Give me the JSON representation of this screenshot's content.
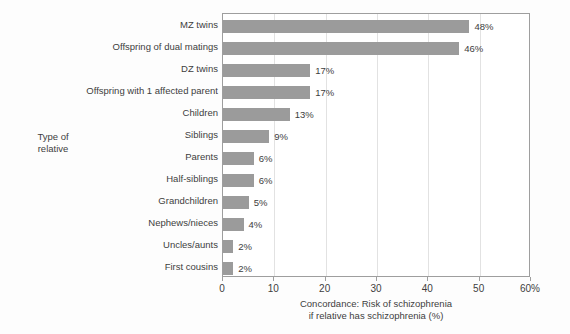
{
  "chart_data": {
    "type": "bar",
    "orientation": "horizontal",
    "title": "",
    "xlabel": "Concordance: Risk of schizophrenia if relative has schizophrenia (%)",
    "xlabel_lines": [
      "Concordance: Risk of schizophrenia",
      "if relative has schizophrenia (%)"
    ],
    "ylabel": "Type of relative",
    "ylabel_lines": [
      "Type of",
      "relative"
    ],
    "categories": [
      "MZ twins",
      "Offspring of dual matings",
      "DZ twins",
      "Offspring with 1 affected parent",
      "Children",
      "Siblings",
      "Parents",
      "Half-siblings",
      "Grandchildren",
      "Nephews/nieces",
      "Uncles/aunts",
      "First cousins"
    ],
    "values": [
      48,
      46,
      17,
      17,
      13,
      9,
      6,
      6,
      5,
      4,
      2,
      2
    ],
    "value_labels": [
      "48%",
      "46%",
      "17%",
      "17%",
      "13%",
      "9%",
      "6%",
      "6%",
      "5%",
      "4%",
      "2%",
      "2%"
    ],
    "xlim": [
      0,
      60
    ],
    "xticks": [
      0,
      10,
      20,
      30,
      40,
      50,
      60
    ],
    "xtick_labels": [
      "0",
      "10",
      "20",
      "30",
      "40",
      "50",
      "60%"
    ],
    "grid": true,
    "grid_axis": "x",
    "legend": null,
    "colors": {
      "bar": "#9b9b9b",
      "grid": "#e2e2e2",
      "axis": "#9e9e9e",
      "text": "#3d3d3d",
      "background": "#fdfdfd",
      "plot_background": "#ffffff"
    }
  }
}
